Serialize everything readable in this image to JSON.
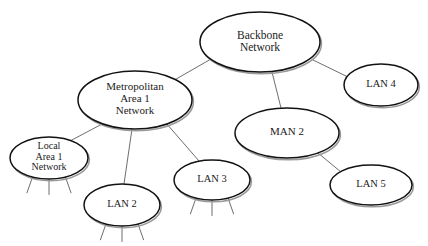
{
  "diagram": {
    "type": "node-link",
    "background_color": "#ffffff",
    "node_fill_color": "#ffffff",
    "node_border_color": "#121212",
    "node_shadow_color": "#9a9a9a",
    "edge_color": "#5c5c5c",
    "text_color": "#1a1a1a",
    "nodes": [
      {
        "id": "backbone",
        "label": "Backbone\nNetwork",
        "lines": [
          "Backbone",
          "Network"
        ],
        "cx": 260,
        "cy": 42,
        "rx": 60,
        "ry": 30,
        "font_size": 11.5,
        "stubs": 0
      },
      {
        "id": "man1",
        "label": "Metropolitan\nArea 1\nNetwork",
        "lines": [
          "Metropolitan",
          "Area 1",
          "Network"
        ],
        "cx": 135,
        "cy": 100,
        "rx": 57,
        "ry": 29,
        "font_size": 11,
        "stubs": 0
      },
      {
        "id": "man2",
        "label": "MAN 2",
        "lines": [
          "MAN 2"
        ],
        "cx": 287,
        "cy": 133,
        "rx": 52,
        "ry": 25,
        "font_size": 11,
        "stubs": 0
      },
      {
        "id": "lan4",
        "label": "LAN 4",
        "lines": [
          "LAN 4"
        ],
        "cx": 381,
        "cy": 85,
        "rx": 37,
        "ry": 21,
        "font_size": 10.5,
        "stubs": 0
      },
      {
        "id": "local1",
        "label": "Local\nArea 1\nNetwork",
        "lines": [
          "Local",
          "Area 1",
          "Network"
        ],
        "cx": 49,
        "cy": 158,
        "rx": 39,
        "ry": 21,
        "font_size": 10,
        "stubs": 3
      },
      {
        "id": "lan2",
        "label": "LAN 2",
        "lines": [
          "LAN 2"
        ],
        "cx": 122,
        "cy": 205,
        "rx": 38,
        "ry": 21,
        "font_size": 10.5,
        "stubs": 3
      },
      {
        "id": "lan3",
        "label": "LAN 3",
        "lines": [
          "LAN 3"
        ],
        "cx": 212,
        "cy": 180,
        "rx": 38,
        "ry": 20,
        "font_size": 10.5,
        "stubs": 3
      },
      {
        "id": "lan5",
        "label": "LAN 5",
        "lines": [
          "LAN 5"
        ],
        "cx": 371,
        "cy": 185,
        "rx": 41,
        "ry": 20,
        "font_size": 10.5,
        "stubs": 0
      }
    ],
    "edges": [
      {
        "from": "backbone",
        "to": "man1",
        "x1": 211,
        "y1": 59,
        "x2": 171,
        "y2": 82
      },
      {
        "from": "backbone",
        "to": "man2",
        "x1": 272,
        "y1": 72,
        "x2": 281,
        "y2": 108
      },
      {
        "from": "backbone",
        "to": "lan4",
        "x1": 313,
        "y1": 60,
        "x2": 348,
        "y2": 77
      },
      {
        "from": "man1",
        "to": "local1",
        "x1": 104,
        "y1": 123,
        "x2": 70,
        "y2": 141
      },
      {
        "from": "man1",
        "to": "lan2",
        "x1": 132,
        "y1": 129,
        "x2": 124,
        "y2": 184
      },
      {
        "from": "man1",
        "to": "lan3",
        "x1": 166,
        "y1": 123,
        "x2": 199,
        "y2": 161
      },
      {
        "from": "man2",
        "to": "lan5",
        "x1": 318,
        "y1": 153,
        "x2": 341,
        "y2": 172
      }
    ]
  }
}
